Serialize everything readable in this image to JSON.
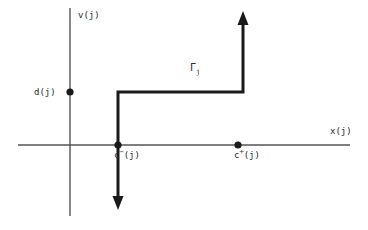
{
  "figure": {
    "background_color": "#ffffff",
    "axis_color": "#555555",
    "path_color": "#1a1a1a",
    "text_color": "#2b2b2b",
    "axes": {
      "x_axis": {
        "label": "x(j)",
        "orientation": "horizontal",
        "y_pixel": 145,
        "x_start": 18,
        "x_end": 350
      },
      "y_axis": {
        "label": "v(j)",
        "orientation": "vertical",
        "x_pixel": 70,
        "y_start": 8,
        "y_end": 216
      },
      "origin": {
        "x": 70,
        "y": 145
      }
    },
    "labels": {
      "y_axis_label": "v(j)",
      "x_axis_label": "x(j)",
      "d_label": "d(j)",
      "c_minus_base": "c",
      "c_minus_sup": "−",
      "c_minus_arg": "(j)",
      "c_plus_base": "c",
      "c_plus_sup": "+",
      "c_plus_arg": "(j)",
      "gamma_base": "Γ",
      "gamma_sub": "j"
    },
    "points": [
      {
        "name": "d-point",
        "label": "d(j)",
        "x": 70,
        "y": 92,
        "on_axis": "y",
        "radius": 3.5
      },
      {
        "name": "c-minus-point",
        "label": "c−(j)",
        "x": 118,
        "y": 145,
        "on_axis": "x",
        "radius": 3.5
      },
      {
        "name": "c-plus-point",
        "label": "c+(j)",
        "x": 238,
        "y": 145,
        "on_axis": "x",
        "radius": 3.5
      }
    ],
    "path": {
      "name": "gamma-j-path",
      "label": "Γj",
      "stroke_width": 3,
      "description": "Staircase contour: arrow down at x=118, up through c-minus to v=d(j), right to x=243, then up with arrow",
      "vertices": [
        {
          "x": 118,
          "y": 200
        },
        {
          "x": 118,
          "y": 92
        },
        {
          "x": 243,
          "y": 92
        },
        {
          "x": 243,
          "y": 20
        }
      ],
      "arrowheads": [
        {
          "name": "down-arrowhead",
          "x": 118,
          "y": 205,
          "direction": "down"
        },
        {
          "name": "up-arrowhead",
          "x": 243,
          "y": 15,
          "direction": "up"
        }
      ]
    }
  }
}
